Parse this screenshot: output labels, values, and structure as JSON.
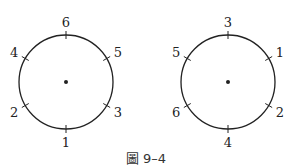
{
  "figure": {
    "caption": "圖 9–4",
    "circles": [
      {
        "name": "left",
        "labels": {
          "top": "6",
          "upper-right": "5",
          "lower-right": "3",
          "bottom": "1",
          "lower-left": "2",
          "upper-left": "4"
        }
      },
      {
        "name": "right",
        "labels": {
          "top": "3",
          "upper-right": "1",
          "lower-right": "2",
          "bottom": "4",
          "lower-left": "6",
          "upper-left": "5"
        }
      }
    ],
    "colors": {
      "stroke": "#222222",
      "background": "#ffffff"
    }
  }
}
